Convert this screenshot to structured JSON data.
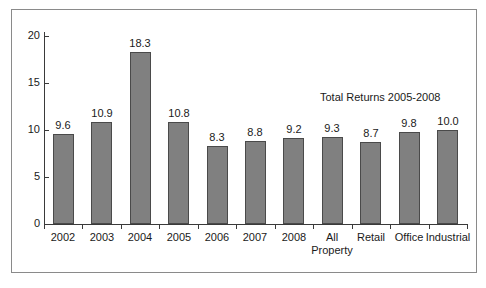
{
  "chart_data": {
    "type": "bar",
    "title": "",
    "subtitle": "",
    "annotation": "Total Returns 2005-2008",
    "categories": [
      "2002",
      "2003",
      "2004",
      "2005",
      "2006",
      "2007",
      "2008",
      "All Property",
      "Retail",
      "Office",
      "Industrial"
    ],
    "category_lines": [
      [
        "2002"
      ],
      [
        "2003"
      ],
      [
        "2004"
      ],
      [
        "2005"
      ],
      [
        "2006"
      ],
      [
        "2007"
      ],
      [
        "2008"
      ],
      [
        "All",
        "Property"
      ],
      [
        "Retail"
      ],
      [
        "Office"
      ],
      [
        "Industrial"
      ]
    ],
    "values": [
      9.6,
      10.9,
      18.3,
      10.8,
      8.3,
      8.8,
      9.2,
      9.3,
      8.7,
      9.8,
      10.0
    ],
    "value_labels": [
      "9.6",
      "10.9",
      "18.3",
      "10.8",
      "8.3",
      "8.8",
      "9.2",
      "9.3",
      "8.7",
      "9.8",
      "10.0"
    ],
    "xlabel": "",
    "ylabel": "",
    "ylim": [
      0,
      20
    ],
    "yticks": [
      0,
      5,
      10,
      15,
      20
    ],
    "ytick_labels": [
      "0",
      "5",
      "10",
      "15",
      "20"
    ],
    "grid": false,
    "legend": false,
    "legend_position": "none",
    "bar_color": "#808080",
    "bar_border_color": "#4a4a4a",
    "axis_color": "#3a3a3a",
    "text_color": "#1a1a1a",
    "frame_color": "#8a8a8a",
    "background_color": "#ffffff"
  }
}
